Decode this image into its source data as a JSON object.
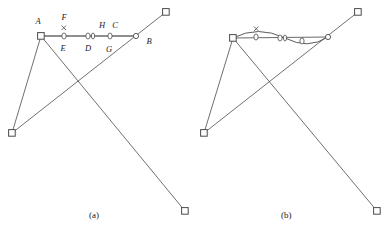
{
  "figure": {
    "type": "geometric-diagram",
    "width": 385,
    "height": 236,
    "background": "#ffffff",
    "stroke_color": "#4a4a4a",
    "label_color": "#1a1a1a",
    "panels": [
      {
        "id": "a",
        "caption": "(a)",
        "caption_x": 89,
        "caption_y": 210,
        "segment_style": "straight",
        "labels": [
          {
            "text": "A",
            "x": 38,
            "y": 24,
            "anchor": "middle"
          },
          {
            "text": "F",
            "x": 64,
            "y": 20,
            "anchor": "middle"
          },
          {
            "text": "E",
            "x": 63,
            "y": 51,
            "anchor": "middle"
          },
          {
            "text": "D",
            "x": 88,
            "y": 51,
            "anchor": "middle"
          },
          {
            "text": "H",
            "x": 102,
            "y": 28,
            "anchor": "middle"
          },
          {
            "text": "C",
            "x": 115,
            "y": 28,
            "anchor": "middle"
          },
          {
            "text": "G",
            "x": 109,
            "y": 52,
            "anchor": "middle"
          },
          {
            "text": "B",
            "x": 149,
            "y": 44,
            "anchor": "middle"
          }
        ],
        "square_vertices": [
          {
            "name": "A",
            "x": 41,
            "y": 36
          },
          {
            "name": "top-right",
            "x": 166,
            "y": 12
          },
          {
            "name": "bottom-left",
            "x": 12,
            "y": 133
          },
          {
            "name": "bottom-right",
            "x": 185,
            "y": 211
          }
        ],
        "segment_nodes": [
          {
            "x": 41,
            "y": 36
          },
          {
            "x": 64,
            "y": 36
          },
          {
            "x": 88,
            "y": 36
          },
          {
            "x": 93,
            "y": 36
          },
          {
            "x": 110,
            "y": 36
          },
          {
            "x": 136,
            "y": 36
          }
        ],
        "crossing_point": {
          "x": 82,
          "y": 82
        }
      },
      {
        "id": "b",
        "caption": "(b)",
        "caption_x": 281,
        "caption_y": 210,
        "segment_style": "wavy",
        "labels": [],
        "square_vertices": [
          {
            "name": "A",
            "x": 233,
            "y": 38
          },
          {
            "name": "top-right",
            "x": 358,
            "y": 12
          },
          {
            "name": "bottom-left",
            "x": 204,
            "y": 133
          },
          {
            "name": "bottom-right",
            "x": 377,
            "y": 211
          }
        ],
        "segment_nodes": [
          {
            "x": 233,
            "y": 38
          },
          {
            "x": 256,
            "y": 37
          },
          {
            "x": 280,
            "y": 38
          },
          {
            "x": 285,
            "y": 38
          },
          {
            "x": 302,
            "y": 41
          },
          {
            "x": 328,
            "y": 37
          }
        ],
        "crossing_point": {
          "x": 274,
          "y": 82
        }
      }
    ]
  }
}
